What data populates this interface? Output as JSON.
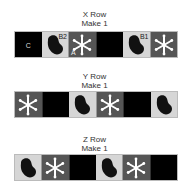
{
  "colors": {
    "black_tile": "#000000",
    "mitten_tile_bg": "#d6d6d6",
    "mitten": "#111111",
    "snow_tile_bg": "#555555",
    "snowflake": "#ffffff"
  },
  "rows": [
    {
      "title": "X Row",
      "subtitle": "Make 1",
      "tiles": [
        {
          "type": "black",
          "label": "C"
        },
        {
          "type": "mitten",
          "label": "B2"
        },
        {
          "type": "snowflake",
          "label": "A"
        },
        {
          "type": "black",
          "label": ""
        },
        {
          "type": "mitten",
          "label": "B1"
        },
        {
          "type": "snowflake",
          "label": ""
        }
      ]
    },
    {
      "title": "Y Row",
      "subtitle": "Make 1",
      "tiles": [
        {
          "type": "snowflake",
          "label": ""
        },
        {
          "type": "black",
          "label": ""
        },
        {
          "type": "mitten",
          "label": ""
        },
        {
          "type": "snowflake",
          "label": ""
        },
        {
          "type": "black",
          "label": ""
        },
        {
          "type": "mitten",
          "label": ""
        }
      ]
    },
    {
      "title": "Z Row",
      "subtitle": "Make 1",
      "tiles": [
        {
          "type": "mitten",
          "label": ""
        },
        {
          "type": "snowflake",
          "label": ""
        },
        {
          "type": "black",
          "label": ""
        },
        {
          "type": "mitten",
          "label": ""
        },
        {
          "type": "snowflake",
          "label": ""
        },
        {
          "type": "black",
          "label": ""
        }
      ]
    }
  ]
}
